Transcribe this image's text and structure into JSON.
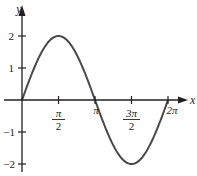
{
  "chart_data": {
    "type": "line",
    "title": "",
    "function": "y = 2 sin(x)",
    "xlabel": "x",
    "ylabel": "y",
    "xlim": [
      0,
      6.2832
    ],
    "ylim": [
      -2,
      2
    ],
    "grid": false,
    "legend": null,
    "x_ticks": [
      {
        "value": 1.5708,
        "label_num": "π",
        "label_den": "2",
        "pos": 58.5
      },
      {
        "value": 3.1416,
        "label": "π",
        "pos": 95
      },
      {
        "value": 4.7124,
        "label_num": "3π",
        "label_den": "2",
        "pos": 131.5
      },
      {
        "value": 6.2832,
        "label": "2π",
        "pos": 168
      }
    ],
    "y_ticks": [
      {
        "value": 2,
        "label": "2",
        "pos": 36
      },
      {
        "value": 1,
        "label": "1",
        "pos": 68
      },
      {
        "value": -1,
        "label": "−1",
        "pos": 132
      },
      {
        "value": -2,
        "label": "−2",
        "pos": 164
      }
    ],
    "series": [
      {
        "name": "2 sin x",
        "x": [
          0,
          0.7854,
          1.5708,
          2.3562,
          3.1416,
          3.927,
          4.7124,
          5.4978,
          6.2832
        ],
        "y": [
          0,
          1.414,
          2,
          1.414,
          0,
          -1.414,
          -2,
          -1.414,
          0
        ],
        "color": "#4a4a4a"
      }
    ],
    "layout": {
      "origin_px": [
        22,
        100
      ],
      "px_per_x": 23.24,
      "px_per_y": 32,
      "x_axis_end": 186,
      "y_axis_top": 6,
      "y_axis_bottom": 172,
      "axis_color": "#231f20",
      "curve_color": "#4a4a4a"
    }
  },
  "labels": {
    "x_axis": "x",
    "y_axis": "y",
    "pi_half_num": "π",
    "pi_half_den": "2",
    "pi": "π",
    "three_pi_half_num": "3π",
    "three_pi_half_den": "2",
    "two_pi": "2π",
    "y2": "2",
    "y1": "1",
    "ym1": "−1",
    "ym2": "−2"
  }
}
